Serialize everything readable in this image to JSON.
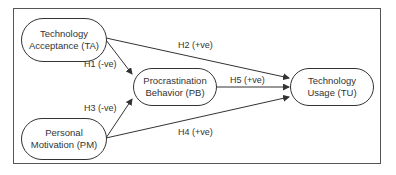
{
  "diagram": {
    "nodes": [
      {
        "id": "TA",
        "line1": "Technology",
        "line2": "Acceptance (TA)"
      },
      {
        "id": "PB",
        "line1": "Procrastination",
        "line2": "Behavior (PB)"
      },
      {
        "id": "TU",
        "line1": "Technology",
        "line2": "Usage (TU)"
      },
      {
        "id": "PM",
        "line1": "Personal",
        "line2": "Motivation (PM)"
      }
    ],
    "edges": [
      {
        "from": "TA",
        "to": "PB",
        "label": "H1 (-ve)"
      },
      {
        "from": "TA",
        "to": "TU",
        "label": "H2 (+ve)"
      },
      {
        "from": "PM",
        "to": "PB",
        "label": "H3 (-ve)"
      },
      {
        "from": "PM",
        "to": "TU",
        "label": "H4 (+ve)"
      },
      {
        "from": "PB",
        "to": "TU",
        "label": "H5 (+ve)"
      }
    ]
  }
}
